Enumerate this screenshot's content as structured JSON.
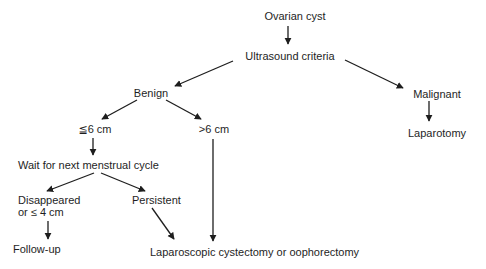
{
  "diagram": {
    "type": "flowchart",
    "topic": "Management of ovarian cyst"
  },
  "colors": {
    "background": "#ffffff",
    "text": "#1e1e1e",
    "line": "#1e1e1e"
  },
  "nodes": {
    "ovarian_cyst": "Ovarian cyst",
    "ultrasound_criteria": "Ultrasound criteria",
    "benign": "Benign",
    "malignant": "Malignant",
    "laparotomy": "Laparotomy",
    "le_6cm": "≦6 cm",
    "gt_6cm": ">6 cm",
    "wait_cycle": "Wait for next menstrual cycle",
    "disappeared_line1": "Disappeared",
    "disappeared_line2": "or ≤ 4 cm",
    "persistent": "Persistent",
    "follow_up": "Follow-up",
    "laparoscopic": "Laparoscopic cystectomy or oophorectomy"
  },
  "edges": [
    {
      "from": "Ovarian cyst",
      "to": "Ultrasound criteria"
    },
    {
      "from": "Ultrasound criteria",
      "to": "Benign"
    },
    {
      "from": "Ultrasound criteria",
      "to": "Malignant"
    },
    {
      "from": "Malignant",
      "to": "Laparotomy"
    },
    {
      "from": "Benign",
      "to": "≦6 cm"
    },
    {
      "from": "Benign",
      "to": ">6 cm"
    },
    {
      "from": "≦6 cm",
      "to": "Wait for next menstrual cycle"
    },
    {
      "from": ">6 cm",
      "to": "Laparoscopic cystectomy or oophorectomy"
    },
    {
      "from": "Wait for next menstrual cycle",
      "to": "Disappeared or ≤ 4 cm"
    },
    {
      "from": "Wait for next menstrual cycle",
      "to": "Persistent"
    },
    {
      "from": "Disappeared or ≤ 4 cm",
      "to": "Follow-up"
    },
    {
      "from": "Persistent",
      "to": "Laparoscopic cystectomy or oophorectomy"
    }
  ]
}
